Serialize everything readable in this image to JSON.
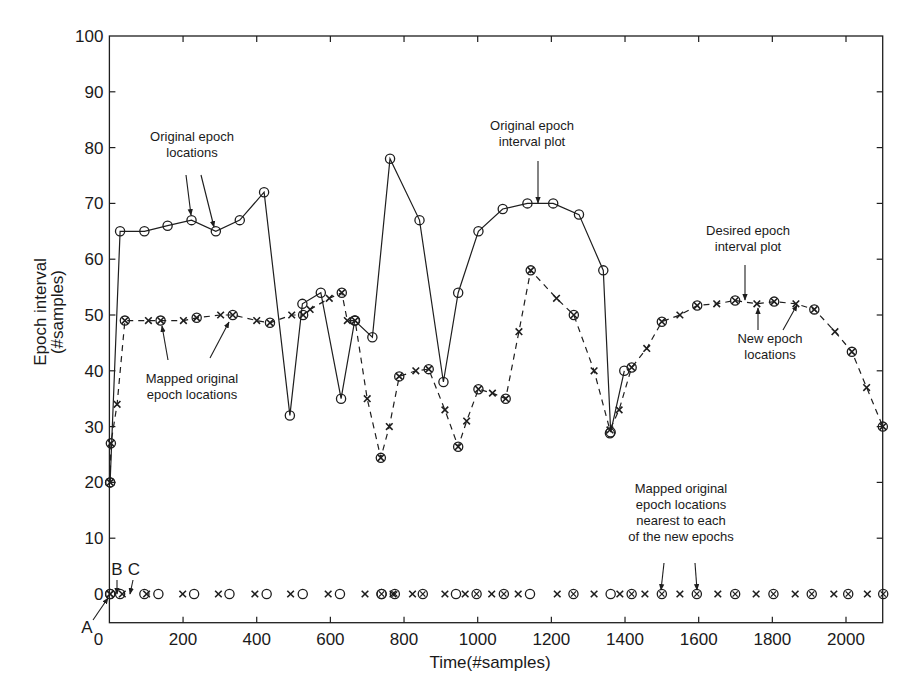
{
  "chart_data": {
    "type": "line",
    "title": "",
    "xlabel": "Time(#samples)",
    "ylabel": [
      "Epoch interval",
      "(#samples)"
    ],
    "xlim": [
      0,
      2100
    ],
    "ylim": [
      -5,
      100
    ],
    "grid": false,
    "x_ticks": [
      0,
      200,
      400,
      600,
      800,
      1000,
      1200,
      1400,
      1600,
      1800,
      2000
    ],
    "y_ticks": [
      0,
      10,
      20,
      30,
      40,
      50,
      60,
      70,
      80,
      90,
      100
    ],
    "series": [
      {
        "name": "Original epoch interval plot",
        "style": "solid",
        "marker": "circle",
        "points": [
          [
            2,
            20
          ],
          [
            29,
            65
          ],
          [
            95,
            65
          ],
          [
            158,
            66
          ],
          [
            223,
            67
          ],
          [
            289,
            65
          ],
          [
            354,
            67
          ],
          [
            420,
            72
          ],
          [
            490,
            32
          ],
          [
            524,
            52
          ],
          [
            574,
            54
          ],
          [
            629,
            35
          ],
          [
            666,
            49
          ],
          [
            714,
            46
          ],
          [
            762,
            78
          ],
          [
            842,
            67
          ],
          [
            907,
            38
          ],
          [
            947,
            54
          ],
          [
            1002,
            65
          ],
          [
            1068,
            69
          ],
          [
            1135,
            70
          ],
          [
            1205,
            70
          ],
          [
            1275,
            68
          ],
          [
            1341,
            58
          ],
          [
            1361,
            29
          ],
          [
            1398,
            40
          ]
        ]
      },
      {
        "name": "Desired epoch interval plot (new epoch locations)",
        "style": "dashed",
        "marker": "x",
        "points": [
          [
            2,
            20
          ],
          [
            4,
            27
          ],
          [
            21,
            34
          ],
          [
            42,
            49
          ],
          [
            106,
            49
          ],
          [
            139,
            49
          ],
          [
            201,
            49
          ],
          [
            237,
            49.5
          ],
          [
            302,
            50
          ],
          [
            335,
            50
          ],
          [
            400,
            49
          ],
          [
            436,
            48.6
          ],
          [
            495,
            50
          ],
          [
            526,
            50
          ],
          [
            545,
            51
          ],
          [
            597,
            53
          ],
          [
            631,
            54
          ],
          [
            646,
            49
          ],
          [
            667,
            49
          ],
          [
            700,
            35
          ],
          [
            737,
            24.4
          ],
          [
            760,
            30
          ],
          [
            787,
            39
          ],
          [
            832,
            40
          ],
          [
            867,
            40.3
          ],
          [
            911,
            33
          ],
          [
            947,
            26.4
          ],
          [
            970,
            31
          ],
          [
            1002,
            36.7
          ],
          [
            1040,
            36
          ],
          [
            1076,
            35
          ],
          [
            1112,
            47
          ],
          [
            1144,
            58
          ],
          [
            1214,
            53
          ],
          [
            1261,
            50
          ],
          [
            1316,
            40
          ],
          [
            1359,
            29.4
          ],
          [
            1384,
            33
          ],
          [
            1418,
            40.6
          ],
          [
            1459,
            44
          ],
          [
            1500,
            48.8
          ],
          [
            1549,
            50
          ],
          [
            1596,
            51.7
          ],
          [
            1649,
            52
          ],
          [
            1699,
            52.6
          ],
          [
            1758,
            52
          ],
          [
            1805,
            52.4
          ],
          [
            1864,
            52
          ],
          [
            1914,
            51
          ],
          [
            1970,
            47
          ],
          [
            2016,
            43.4
          ],
          [
            2056,
            37
          ],
          [
            2100,
            30
          ]
        ]
      },
      {
        "name": "Mapped original epoch locations (circles on dashed)",
        "style": "none",
        "marker": "circle",
        "points": [
          [
            2,
            20
          ],
          [
            4,
            27
          ],
          [
            42,
            49
          ],
          [
            139,
            49
          ],
          [
            237,
            49.5
          ],
          [
            335,
            50
          ],
          [
            436,
            48.6
          ],
          [
            526,
            50
          ],
          [
            631,
            54
          ],
          [
            667,
            49
          ],
          [
            737,
            24.4
          ],
          [
            787,
            39
          ],
          [
            867,
            40.3
          ],
          [
            947,
            26.4
          ],
          [
            1002,
            36.7
          ],
          [
            1076,
            35
          ],
          [
            1144,
            58
          ],
          [
            1261,
            50
          ],
          [
            1359,
            28.8
          ],
          [
            1418,
            40.6
          ],
          [
            1500,
            48.8
          ],
          [
            1596,
            51.7
          ],
          [
            1699,
            52.6
          ],
          [
            1805,
            52.4
          ],
          [
            1914,
            51
          ],
          [
            2016,
            43.4
          ],
          [
            2100,
            30
          ]
        ]
      },
      {
        "name": "New epoch locations (x at 0)",
        "style": "none",
        "marker": "x",
        "y": 0,
        "x": [
          2,
          35,
          101,
          199,
          296,
          395,
          492,
          594,
          694,
          770,
          823,
          911,
          966,
          1038,
          1110,
          1216,
          1316,
          1386,
          1454,
          1549,
          1652,
          1756,
          1862,
          1967,
          2058
        ]
      },
      {
        "name": "Original epoch locations (circles at 0)",
        "style": "none",
        "marker": "circle",
        "y": 0,
        "x": [
          2,
          29,
          95,
          133,
          230,
          326,
          427,
          525,
          626,
          739,
          941,
          1142,
          1361
        ]
      },
      {
        "name": "Mapped original epoch locations nearest to each of the new epochs (⊗ at 0)",
        "style": "none",
        "marker": "circled-x",
        "y": 0,
        "x": [
          2,
          739,
          775,
          851,
          997,
          1071,
          1260,
          1418,
          1500,
          1595,
          1699,
          1803,
          1907,
          2006,
          2101
        ]
      }
    ],
    "annotations": [
      {
        "text": [
          "Original epoch",
          "locations"
        ],
        "x": 192,
        "y": 141,
        "arrows": [
          [
            186,
            175,
            191,
            215
          ],
          [
            201,
            175,
            214,
            227
          ]
        ]
      },
      {
        "text": [
          "Original epoch",
          "interval plot"
        ],
        "x": 532,
        "y": 130,
        "arrows": [
          [
            538,
            161,
            538,
            203
          ]
        ]
      },
      {
        "text": [
          "Desired epoch",
          "interval plot"
        ],
        "x": 748,
        "y": 235,
        "arrows": [
          [
            745,
            265,
            745,
            300
          ]
        ]
      },
      {
        "text": [
          "New epoch",
          "locations"
        ],
        "x": 770,
        "y": 343,
        "arrows": [
          [
            758,
            330,
            758,
            308
          ],
          [
            783,
            330,
            797,
            305
          ]
        ]
      },
      {
        "text": [
          "Mapped original",
          "epoch locations"
        ],
        "x": 192,
        "y": 383,
        "arrows": [
          [
            168,
            360,
            162,
            326
          ],
          [
            210,
            358,
            229,
            322
          ]
        ]
      },
      {
        "text": [
          "Mapped original",
          "epoch locations",
          "nearest to each",
          "of the new epochs"
        ],
        "x": 681,
        "y": 493,
        "arrows": [
          [
            664,
            563,
            661,
            590
          ],
          [
            695,
            563,
            697,
            590
          ]
        ]
      },
      {
        "text": [
          "A"
        ],
        "x": 87,
        "y": 633,
        "arrows": [
          [
            93,
            620,
            108,
            598
          ]
        ]
      },
      {
        "text": [
          "B"
        ],
        "x": 117,
        "y": 575,
        "arrows": [
          [
            117,
            580,
            117,
            594
          ]
        ]
      },
      {
        "text": [
          "C"
        ],
        "x": 134,
        "y": 575,
        "arrows": [
          [
            133,
            580,
            130,
            594
          ]
        ]
      }
    ]
  },
  "labels": {
    "xlabel": "Time(#samples)",
    "ylabel_line1": "Epoch interval",
    "ylabel_line2": "(#samples)"
  }
}
